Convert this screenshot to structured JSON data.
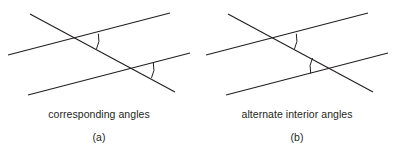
{
  "figure": {
    "background_color": "#ffffff",
    "line_color": "#231f20",
    "text_color": "#231f20",
    "panels": [
      {
        "id": "a",
        "caption": "corresponding angles",
        "index_label": "(a)",
        "lines": [
          {
            "name": "transversal",
            "x1": 30,
            "y1": 14,
            "x2": 175,
            "y2": 92
          },
          {
            "name": "parallel-line-upper",
            "x1": 8,
            "y1": 55,
            "x2": 170,
            "y2": 13
          },
          {
            "name": "parallel-line-lower",
            "x1": 28,
            "y1": 95,
            "x2": 190,
            "y2": 53
          }
        ],
        "intersections": [
          {
            "name": "upper-intersection",
            "x": 78,
            "y": 39
          },
          {
            "name": "lower-intersection",
            "x": 133,
            "y": 68
          }
        ],
        "arcs": [
          {
            "name": "upper-angle-arc",
            "cx": 78,
            "cy": 39,
            "radius": 21,
            "opens": "right"
          },
          {
            "name": "lower-angle-arc",
            "cx": 133,
            "cy": 68,
            "radius": 21,
            "opens": "right"
          }
        ]
      },
      {
        "id": "b",
        "caption": "alternate interior angles",
        "index_label": "(b)",
        "lines": [
          {
            "name": "transversal",
            "x1": 30,
            "y1": 14,
            "x2": 175,
            "y2": 92
          },
          {
            "name": "parallel-line-upper",
            "x1": 8,
            "y1": 55,
            "x2": 170,
            "y2": 13
          },
          {
            "name": "parallel-line-lower",
            "x1": 28,
            "y1": 95,
            "x2": 190,
            "y2": 53
          }
        ],
        "intersections": [
          {
            "name": "upper-intersection",
            "x": 78,
            "y": 39
          },
          {
            "name": "lower-intersection",
            "x": 133,
            "y": 68
          }
        ],
        "arcs": [
          {
            "name": "upper-angle-arc",
            "cx": 78,
            "cy": 39,
            "radius": 21,
            "opens": "right"
          },
          {
            "name": "lower-angle-arc",
            "cx": 133,
            "cy": 68,
            "radius": 21,
            "opens": "left"
          }
        ]
      }
    ]
  }
}
